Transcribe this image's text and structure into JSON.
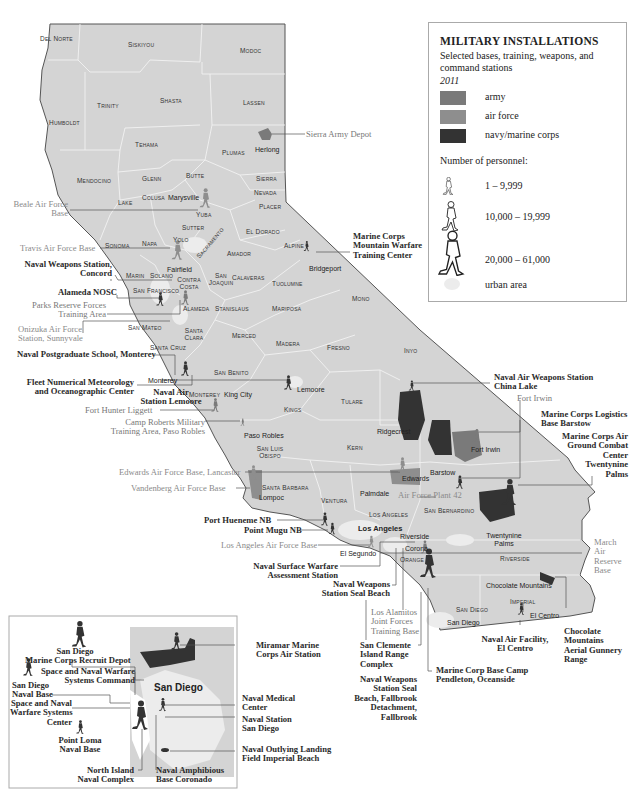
{
  "legend": {
    "title": "MILITARY INSTALLATIONS",
    "subtitle": "Selected bases, training, weapons, and command stations",
    "year": "2011",
    "categories": [
      {
        "label": "army",
        "color": "#7a7a7a"
      },
      {
        "label": "air force",
        "color": "#8e8e8e"
      },
      {
        "label": "navy/marine corps",
        "color": "#333333"
      }
    ],
    "personnel_heading": "Number of personnel:",
    "personnel_ranges": [
      {
        "label": "1 – 9,999",
        "icon": "walking-soldier-small-icon"
      },
      {
        "label": "10,000 – 19,999",
        "icon": "walking-soldier-medium-icon"
      },
      {
        "label": "20,000 – 61,000",
        "icon": "walking-soldier-large-icon"
      }
    ],
    "urban_label": "urban area"
  },
  "colors": {
    "land": "#d4d4d4",
    "county_border": "#f2f2f2",
    "urban": "#ececec",
    "army": "#7a7a7a",
    "air_force": "#8e8e8e",
    "navy": "#333333",
    "leader_line": "#555555"
  },
  "counties": [
    {
      "name": "Del Norte",
      "x": 40,
      "y": 35
    },
    {
      "name": "Siskiyou",
      "x": 128,
      "y": 41
    },
    {
      "name": "Modoc",
      "x": 240,
      "y": 47
    },
    {
      "name": "Trinity",
      "x": 97,
      "y": 102
    },
    {
      "name": "Shasta",
      "x": 160,
      "y": 97
    },
    {
      "name": "Lassen",
      "x": 243,
      "y": 99
    },
    {
      "name": "Humboldt",
      "x": 49,
      "y": 119
    },
    {
      "name": "Tehama",
      "x": 135,
      "y": 141
    },
    {
      "name": "Plumas",
      "x": 222,
      "y": 149
    },
    {
      "name": "Butte",
      "x": 186,
      "y": 172
    },
    {
      "name": "Sierra",
      "x": 256,
      "y": 175
    },
    {
      "name": "Mendocino",
      "x": 77,
      "y": 177
    },
    {
      "name": "Glenn",
      "x": 142,
      "y": 175
    },
    {
      "name": "Nevada",
      "x": 254,
      "y": 189
    },
    {
      "name": "Lake",
      "x": 118,
      "y": 199
    },
    {
      "name": "Colusa",
      "x": 142,
      "y": 194
    },
    {
      "name": "Placer",
      "x": 259,
      "y": 203
    },
    {
      "name": "Yuba",
      "x": 196,
      "y": 211
    },
    {
      "name": "Sutter",
      "x": 182,
      "y": 224
    },
    {
      "name": "El Dorado",
      "x": 246,
      "y": 228
    },
    {
      "name": "Yolo",
      "x": 173,
      "y": 236
    },
    {
      "name": "Sonoma",
      "x": 105,
      "y": 242
    },
    {
      "name": "Napa",
      "x": 142,
      "y": 240
    },
    {
      "name": "Alpine",
      "x": 284,
      "y": 242
    },
    {
      "name": "Amador",
      "x": 227,
      "y": 250
    },
    {
      "name": "Sacramento",
      "x": 195,
      "y": 255
    },
    {
      "name": "Marin",
      "x": 126,
      "y": 272
    },
    {
      "name": "Solano",
      "x": 150,
      "y": 272
    },
    {
      "name": "San Joaquin",
      "x": 206,
      "y": 272
    },
    {
      "name": "Calaveras",
      "x": 232,
      "y": 274
    },
    {
      "name": "Contra Costa",
      "x": 175,
      "y": 276
    },
    {
      "name": "Tuolumne",
      "x": 272,
      "y": 280
    },
    {
      "name": "San Francisco",
      "x": 133,
      "y": 287
    },
    {
      "name": "Mono",
      "x": 352,
      "y": 295
    },
    {
      "name": "Alameda",
      "x": 183,
      "y": 305
    },
    {
      "name": "Stanislaus",
      "x": 215,
      "y": 305
    },
    {
      "name": "Mariposa",
      "x": 272,
      "y": 305
    },
    {
      "name": "San Mateo",
      "x": 128,
      "y": 324
    },
    {
      "name": "Santa Clara",
      "x": 183,
      "y": 327
    },
    {
      "name": "Merced",
      "x": 232,
      "y": 332
    },
    {
      "name": "Madera",
      "x": 276,
      "y": 340
    },
    {
      "name": "Fresno",
      "x": 327,
      "y": 344
    },
    {
      "name": "Inyo",
      "x": 404,
      "y": 347
    },
    {
      "name": "Santa Cruz",
      "x": 150,
      "y": 344
    },
    {
      "name": "San Benito",
      "x": 214,
      "y": 369
    },
    {
      "name": "Monterey",
      "x": 189,
      "y": 391
    },
    {
      "name": "Kings",
      "x": 284,
      "y": 406
    },
    {
      "name": "Tulare",
      "x": 341,
      "y": 398
    },
    {
      "name": "Kern",
      "x": 347,
      "y": 444
    },
    {
      "name": "San Luis Obispo",
      "x": 252,
      "y": 445
    },
    {
      "name": "Santa Barbara",
      "x": 262,
      "y": 487
    },
    {
      "name": "Ventura",
      "x": 321,
      "y": 497
    },
    {
      "name": "Los Angeles",
      "x": 369,
      "y": 511
    },
    {
      "name": "San Bernardino",
      "x": 424,
      "y": 507
    },
    {
      "name": "Orange",
      "x": 400,
      "y": 555
    },
    {
      "name": "Riverside",
      "x": 500,
      "y": 555
    },
    {
      "name": "San Diego",
      "x": 456,
      "y": 606
    },
    {
      "name": "Imperial",
      "x": 510,
      "y": 598
    }
  ],
  "cities": [
    {
      "name": "Herlong",
      "x": 262,
      "y": 147
    },
    {
      "name": "Marysville",
      "x": 168,
      "y": 194
    },
    {
      "name": "Fairfield",
      "x": 167,
      "y": 266
    },
    {
      "name": "Bridgeport",
      "x": 309,
      "y": 268
    },
    {
      "name": "Monterey",
      "x": 148,
      "y": 377
    },
    {
      "name": "Lemoore",
      "x": 297,
      "y": 389
    },
    {
      "name": "King City",
      "x": 224,
      "y": 394
    },
    {
      "name": "Ridgecrest",
      "x": 377,
      "y": 430
    },
    {
      "name": "Fort Irwin",
      "x": 471,
      "y": 448
    },
    {
      "name": "Paso Robles",
      "x": 244,
      "y": 434
    },
    {
      "name": "Barstow",
      "x": 430,
      "y": 469
    },
    {
      "name": "Edwards",
      "x": 398,
      "y": 477
    },
    {
      "name": "Lompoc",
      "x": 259,
      "y": 494
    },
    {
      "name": "Palmdale",
      "x": 360,
      "y": 492
    },
    {
      "name": "Los Angeles",
      "x": 358,
      "y": 526,
      "bold": true
    },
    {
      "name": "Riverside",
      "x": 400,
      "y": 535
    },
    {
      "name": "El Segundo",
      "x": 340,
      "y": 553
    },
    {
      "name": "Corona",
      "x": 400,
      "y": 546
    },
    {
      "name": "Twentynine Palms",
      "x": 483,
      "y": 534
    },
    {
      "name": "Chocolate Mountains",
      "x": 486,
      "y": 582
    },
    {
      "name": "El Centro",
      "x": 530,
      "y": 614
    },
    {
      "name": "San Diego",
      "x": 447,
      "y": 621
    },
    {
      "name": "Santa Barbara",
      "x": 262,
      "y": 487
    }
  ],
  "installations": [
    {
      "name": "Sierra Army Depot",
      "branch": "army"
    },
    {
      "name": "Beale Air Force Base",
      "branch": "air force"
    },
    {
      "name": "Travis Air Force Base",
      "branch": "air force"
    },
    {
      "name": "Naval Weapons Station, Concord",
      "branch": "navy/marine corps"
    },
    {
      "name": "Alameda NOSC",
      "branch": "navy/marine corps"
    },
    {
      "name": "Parks Reserve Forces Training Area",
      "branch": "army"
    },
    {
      "name": "Onizuka Air Force Station, Sunnyvale",
      "branch": "air force"
    },
    {
      "name": "Naval Postgraduate School, Monterey",
      "branch": "navy/marine corps"
    },
    {
      "name": "Fleet Numerical Meteorology and Oceanographic Center",
      "branch": "navy/marine corps"
    },
    {
      "name": "Naval Air Station Lemoore",
      "branch": "navy/marine corps"
    },
    {
      "name": "Fort Hunter Liggett",
      "branch": "army"
    },
    {
      "name": "Camp Roberts Military Training Area, Paso Robles",
      "branch": "army"
    },
    {
      "name": "Edwards Air Force Base, Lancaster",
      "branch": "air force"
    },
    {
      "name": "Vandenberg Air Force Base",
      "branch": "air force"
    },
    {
      "name": "Port Hueneme NB",
      "branch": "navy/marine corps"
    },
    {
      "name": "Point Mugu NB",
      "branch": "navy/marine corps"
    },
    {
      "name": "Los Angeles Air Force Base",
      "branch": "air force"
    },
    {
      "name": "Naval Surface Warfare Assessment Station",
      "branch": "navy/marine corps"
    },
    {
      "name": "Naval Weapons Station Seal Beach",
      "branch": "navy/marine corps"
    },
    {
      "name": "Los Alamitos Joint Forces Training Base",
      "branch": "army"
    },
    {
      "name": "San Clemente Island Range Complex",
      "branch": "navy/marine corps"
    },
    {
      "name": "Naval Weapons Station Seal Beach, Fallbrook Detachment, Fallbrook",
      "branch": "navy/marine corps"
    },
    {
      "name": "Marine Corp Base Camp Pendleton, Oceanside",
      "branch": "navy/marine corps"
    },
    {
      "name": "Marine Corps Mountain Warfare Training Center",
      "branch": "navy/marine corps"
    },
    {
      "name": "Naval Air Weapons Station China Lake",
      "branch": "navy/marine corps"
    },
    {
      "name": "Fort Irwin",
      "branch": "army"
    },
    {
      "name": "Marine Corps Logistics Base Barstow",
      "branch": "navy/marine corps"
    },
    {
      "name": "Marine Corps Air Ground Combat Center Twentynine Palms",
      "branch": "navy/marine corps"
    },
    {
      "name": "Air Force Plant 42",
      "branch": "air force"
    },
    {
      "name": "March Air Reserve Base",
      "branch": "air force"
    },
    {
      "name": "Naval Air Facility, El Centro",
      "branch": "navy/marine corps"
    },
    {
      "name": "Chocolate Mountains Aerial Gunnery Range",
      "branch": "navy/marine corps"
    }
  ],
  "labels": {
    "sierra_army_depot": "Sierra Army Depot",
    "beale_1": "Beale Air Force",
    "beale_2": "Base",
    "travis": "Travis Air Force Base",
    "concord_1": "Naval Weapons Station,",
    "concord_2": "Concord",
    "alameda_nosc": "Alameda NOSC",
    "parks_1": "Parks Reserve Forces",
    "parks_2": "Training Area",
    "onizuka_1": "Onizuka Air Force",
    "onizuka_2": "Station, Sunnyvale",
    "nps": "Naval Postgraduate School, Monterey",
    "fleet_1": "Fleet Numerical Meteorology",
    "fleet_2": "and Oceanographic Center",
    "lemoore_1": "Naval Air",
    "lemoore_2": "Station Lemoore",
    "hunter_liggett": "Fort Hunter Liggett",
    "camp_roberts_1": "Camp Roberts Military",
    "camp_roberts_2": "Training Area, Paso Robles",
    "edwards": "Edwards Air Force Base, Lancaster",
    "vandenberg": "Vandenberg Air Force Base",
    "hueneme": "Port Hueneme NB",
    "mugu": "Point Mugu NB",
    "laafb": "Los Angeles Air Force Base",
    "nswas_1": "Naval Surface Warfare",
    "nswas_2": "Assessment Station",
    "seal_beach_1": "Naval Weapons",
    "seal_beach_2": "Station Seal Beach",
    "alamitos_1": "Los Alamitos",
    "alamitos_2": "Joint Forces",
    "alamitos_3": "Training Base",
    "clemente_1": "San Clemente",
    "clemente_2": "Island Range",
    "clemente_3": "Complex",
    "fallbrook_1": "Naval Weapons",
    "fallbrook_2": "Station Seal",
    "fallbrook_3": "Beach, Fallbrook",
    "fallbrook_4": "Detachment,",
    "fallbrook_5": "Fallbrook",
    "pendleton_1": "Marine Corp Base Camp",
    "pendleton_2": "Pendleton, Oceanside",
    "mwtc_1": "Marine Corps",
    "mwtc_2": "Mountain Warfare",
    "mwtc_3": "Training Center",
    "china_lake_1": "Naval Air Weapons Station",
    "china_lake_2": "China Lake",
    "fort_irwin": "Fort Irwin",
    "barstow_1": "Marine Corps Logistics",
    "barstow_2": "Base Barstow",
    "agcc_1": "Marine Corps Air",
    "agcc_2": "Ground Combat",
    "agcc_3": "Center",
    "agcc_4": "Twentynine",
    "agcc_5": "Palms",
    "plant42": "Air Force Plant 42",
    "march_1": "March",
    "march_2": "Air",
    "march_3": "Reserve",
    "march_4": "Base",
    "elcentro_1": "Naval Air Facility,",
    "elcentro_2": "El Centro",
    "choco_1": "Chocolate",
    "choco_2": "Mountains",
    "choco_3": "Aerial Gunnery",
    "choco_4": "Range"
  },
  "inset": {
    "title": "San Diego",
    "labels": {
      "mcrd_1": "San Diego",
      "mcrd_2": "Marine Corps Recruit Depot",
      "spawar_cmd_1": "Space and Naval Warfare",
      "spawar_cmd_2": "Systems Command",
      "sdnb_1": "San Diego",
      "sdnb_2": "Naval Base",
      "spawar_ctr_1": "Space and Naval",
      "spawar_ctr_2": "Warfare Systems",
      "spawar_ctr_3": "Center",
      "loma_1": "Point Loma",
      "loma_2": "Naval Base",
      "north_island_1": "North Island",
      "north_island_2": "Naval Complex",
      "coronado_1": "Naval Amphibious",
      "coronado_2": "Base Coronado",
      "miramar_1": "Miramar Marine",
      "miramar_2": "Corps Air Station",
      "medical_1": "Naval Medical",
      "medical_2": "Center",
      "nssd_1": "Naval Station",
      "nssd_2": "San Diego",
      "imperial_1": "Naval Outlying Landing",
      "imperial_2": "Field Imperial Beach"
    }
  }
}
